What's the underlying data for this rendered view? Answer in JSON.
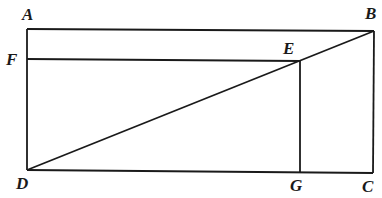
{
  "diagram": {
    "title": "",
    "points": {
      "A": {
        "label": "A",
        "x": 27,
        "y": 29
      },
      "B": {
        "label": "B",
        "x": 374,
        "y": 31
      },
      "C": {
        "label": "C",
        "x": 373,
        "y": 173
      },
      "D": {
        "label": "D",
        "x": 27,
        "y": 170
      },
      "E": {
        "label": "E",
        "x": 300,
        "y": 61
      },
      "F": {
        "label": "F",
        "x": 27,
        "y": 59
      },
      "G": {
        "label": "G",
        "x": 300,
        "y": 172
      }
    },
    "segments": [
      "AB",
      "BC",
      "CD",
      "DA",
      "FE",
      "EG",
      "DB"
    ],
    "labels": {
      "A": "A",
      "B": "B",
      "C": "C",
      "D": "D",
      "E": "E",
      "F": "F",
      "G": "G"
    },
    "colors": {
      "stroke": "#1a1a1a",
      "background": "#ffffff"
    }
  }
}
